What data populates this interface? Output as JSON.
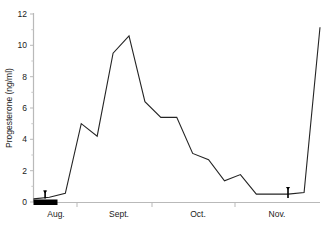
{
  "chart_data": {
    "type": "line",
    "title": "",
    "xlabel": "",
    "ylabel": "Progesterone (ng/ml)",
    "ylim": [
      0,
      12
    ],
    "yticks": [
      0,
      2,
      4,
      6,
      8,
      10,
      12
    ],
    "ytick_labels": [
      "0",
      "2",
      "4",
      "6",
      "8",
      "10",
      "12"
    ],
    "categories": [
      "Aug.",
      "Sept.",
      "Oct.",
      "Nov."
    ],
    "grid": false,
    "legend": null,
    "series": [
      {
        "name": "Progesterone",
        "color": "#242424",
        "x": [
          0,
          1,
          2,
          3,
          4,
          5,
          6,
          7,
          8,
          9,
          10,
          11,
          12,
          13,
          14,
          15,
          16,
          17,
          18
        ],
        "values": [
          0.2,
          0.3,
          0.55,
          5.0,
          4.2,
          9.5,
          10.6,
          6.4,
          5.4,
          5.4,
          3.1,
          2.7,
          1.35,
          1.75,
          0.5,
          0.5,
          0.5,
          0.6,
          11.15
        ]
      }
    ],
    "annotations": [
      {
        "name": "mating-period-bar",
        "kind": "bar",
        "description": "solid black horizontal bar on baseline spanning early August"
      },
      {
        "name": "left-arrow-marker",
        "kind": "down-arrow",
        "description": "small downward arrow marker near start of August"
      },
      {
        "name": "right-arrow-marker",
        "kind": "down-arrow",
        "description": "small downward arrow marker in late November"
      }
    ]
  }
}
